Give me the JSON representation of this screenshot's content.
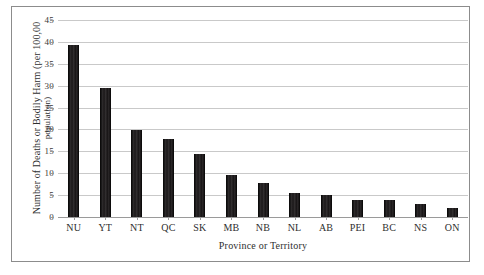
{
  "chart_data": {
    "type": "bar",
    "title": "",
    "xlabel": "Province or Territory",
    "ylabel": "Number of Deaths or Bodily Harm (per 100,00 population)",
    "ylabel_line1": "Number of Deaths or Bodily Harm (per 100,00",
    "ylabel_line2": "population)",
    "categories": [
      "NU",
      "YT",
      "NT",
      "QC",
      "SK",
      "MB",
      "NB",
      "NL",
      "AB",
      "PEI",
      "BC",
      "NS",
      "ON"
    ],
    "values": [
      39.3,
      29.4,
      19.8,
      17.8,
      14.4,
      9.7,
      7.8,
      5.6,
      5.1,
      4.0,
      3.9,
      2.9,
      2.1
    ],
    "ylim": [
      0,
      45
    ],
    "yticks": [
      0,
      5,
      10,
      15,
      20,
      25,
      30,
      35,
      40,
      45
    ],
    "ytick_labels": [
      "0",
      "5",
      "10",
      "15",
      "20",
      "25",
      "30",
      "35",
      "40",
      "45"
    ],
    "grid": true,
    "grid_axis": "y",
    "legend": false,
    "legend_position": "none",
    "bar_color": "#231f20",
    "gridline_color": "#c9c9c9",
    "axis_color": "#9a9a9a",
    "frame_color": "#8c8c8c",
    "background_color": "#ffffff"
  }
}
